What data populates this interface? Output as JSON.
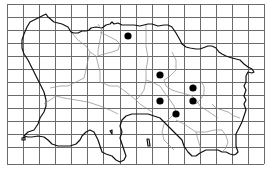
{
  "map": {
    "subject": "Jersey distribution map",
    "grid": {
      "x_lines": [
        7,
        23,
        39,
        55,
        71,
        87,
        103,
        120,
        136,
        152,
        168,
        184,
        200,
        216,
        232,
        248,
        264
      ],
      "y_lines": [
        4,
        17,
        30,
        43,
        56,
        69,
        82,
        95,
        108,
        121,
        134,
        147,
        164
      ],
      "color": "#6a6a6a"
    },
    "records": [
      {
        "x": 128,
        "y": 36
      },
      {
        "x": 160,
        "y": 75
      },
      {
        "x": 193,
        "y": 88
      },
      {
        "x": 160,
        "y": 101
      },
      {
        "x": 193,
        "y": 101
      },
      {
        "x": 176,
        "y": 114
      }
    ],
    "dot_color": "#000000",
    "coast_color": "#111111",
    "boundary_color": "#8a8a8a"
  }
}
